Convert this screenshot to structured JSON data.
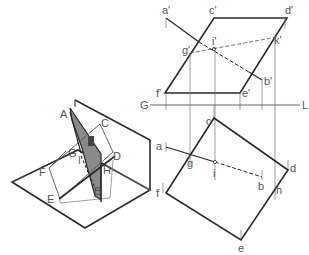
{
  "figure": {
    "type": "descriptive-geometry intersection of line and plane",
    "pictorial_labels": [
      "A",
      "C",
      "G",
      "I",
      "D",
      "F",
      "H",
      "E",
      "B"
    ],
    "projection_labels": {
      "front": [
        "a'",
        "c'",
        "d'",
        "g'",
        "i'",
        "k'",
        "f'",
        "e'",
        "b'"
      ],
      "top": [
        "c",
        "a",
        "g",
        "i",
        "d",
        "f",
        "b",
        "h",
        "e"
      ],
      "ground_line": [
        "G",
        "L"
      ]
    }
  },
  "labels": {
    "A": "A",
    "C": "C",
    "G": "G",
    "I": "I",
    "D": "D",
    "F": "F",
    "H": "H",
    "E": "E",
    "B": "B",
    "a_p": "a'",
    "c_p": "c'",
    "d_p": "d'",
    "g_p": "g'",
    "i_p": "i'",
    "k_p": "k'",
    "f_p": "f'",
    "e_p": "e'",
    "b_p": "b'",
    "GL_G": "G",
    "GL_L": "L",
    "c": "c",
    "a": "a",
    "g": "g",
    "i": "i",
    "d": "d",
    "f": "f",
    "b": "b",
    "h": "h",
    "e": "e"
  },
  "colors": {
    "line": "#2a2a2a",
    "thin": "#777777",
    "shade": "#8a8a8a",
    "label": "#555555"
  }
}
